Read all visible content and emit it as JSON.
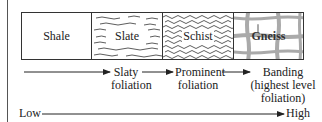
{
  "rocks": [
    {
      "name": "Shale",
      "texture": "plain"
    },
    {
      "name": "Slate",
      "texture": "fine-wavy"
    },
    {
      "name": "Schist",
      "texture": "dense-wavy"
    },
    {
      "name": "Gneiss",
      "texture": "banded-grid"
    }
  ],
  "stages": {
    "slaty": [
      "Slaty",
      "foliation"
    ],
    "prominent": [
      "Prominent",
      "foliation"
    ],
    "banding": [
      "Banding",
      "(highest level",
      "foliation)"
    ]
  },
  "scale": {
    "low": "Low",
    "high": "High"
  }
}
